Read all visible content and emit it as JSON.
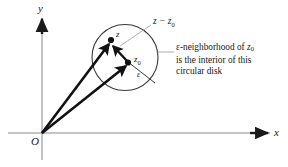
{
  "figure": {
    "background_color": "#ffffff",
    "ink_color": "#1a1a1a",
    "axis_color": "#8a8a8a",
    "circle_color": "#3a3a3a",
    "vector_color": "#111111",
    "leader_color": "#9a9a9a"
  },
  "axes": {
    "y_label": "y",
    "x_label": "x",
    "origin_label": "O"
  },
  "points": {
    "z_label": "z",
    "z0_label": "z",
    "z0_sub": "0"
  },
  "radius": {
    "epsilon_label": "ε"
  },
  "difference": {
    "text_main": "z − z",
    "text_sub": "0"
  },
  "caption": {
    "line1_pre": "ε-neighborhood of ",
    "line1_var": "z",
    "line1_sub": "0",
    "line2": "is the interior of this",
    "line3": "circular disk"
  }
}
